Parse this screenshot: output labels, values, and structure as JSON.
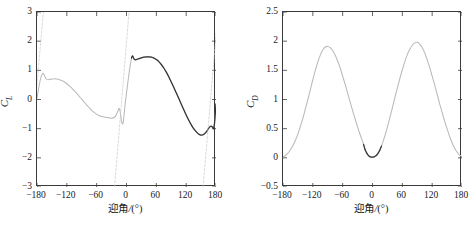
{
  "figure": {
    "width": 474,
    "height": 230,
    "background": "#ffffff"
  },
  "colors": {
    "axis": "#3b3b3b",
    "curve_light": "#b9b9b9",
    "curve_dark": "#343434",
    "dashed_ref": "#c9c9c9",
    "text": "#1a1a1a"
  },
  "panels": [
    {
      "id": "left",
      "ylabel_main": "C",
      "ylabel_sub": "L",
      "xlabel_cn": "迎角",
      "xlabel_unit": "/(°)"
    },
    {
      "id": "right",
      "ylabel_main": "C",
      "ylabel_sub": "D",
      "xlabel_cn": "迎角",
      "xlabel_unit": "/(°)"
    }
  ],
  "chart_data": [
    {
      "type": "line",
      "id": "lift-coefficient-plot",
      "title": "",
      "xlabel": "迎角/(°)",
      "ylabel": "C_L",
      "xlim": [
        -180,
        180
      ],
      "ylim": [
        -3,
        3
      ],
      "xticks": [
        -180,
        -120,
        -60,
        0,
        60,
        120,
        180
      ],
      "xticklabels": [
        "−180",
        "−120",
        "−60",
        "0",
        "60",
        "120",
        "180"
      ],
      "yticks": [
        -3,
        -2,
        -1,
        0,
        1,
        2,
        3
      ],
      "yticklabels": [
        "−3",
        "−2",
        "−1",
        "0",
        "1",
        "2",
        "3"
      ],
      "grid": false,
      "legend": "none",
      "series": [
        {
          "name": "CL-360deg-light",
          "color": "#b9b9b9",
          "style": "solid",
          "x": [
            -180,
            -177,
            -174,
            -171,
            -168,
            -166,
            -164,
            -162,
            -160,
            -157,
            -154,
            -150,
            -145,
            -140,
            -135,
            -130,
            -125,
            -120,
            -115,
            -110,
            -105,
            -100,
            -95,
            -90,
            -85,
            -80,
            -75,
            -70,
            -65,
            -60,
            -55,
            -50,
            -45,
            -40,
            -35,
            -30,
            -25,
            -22,
            -20,
            -18,
            -16,
            -15,
            -14,
            -13,
            -12,
            -11,
            -10,
            -9,
            -8,
            -7,
            -6,
            -5,
            -3,
            0,
            3,
            5,
            7,
            9,
            11,
            12,
            13,
            14,
            15,
            16,
            17,
            18,
            20,
            22,
            25,
            30,
            35,
            40,
            45,
            50,
            55,
            60,
            65,
            70,
            75,
            80,
            85,
            90,
            95,
            100,
            105,
            110,
            115,
            120,
            125,
            130,
            135,
            140,
            145,
            150,
            155,
            160,
            163,
            166,
            169,
            171,
            173,
            175,
            177,
            180
          ],
          "y": [
            0.05,
            0.35,
            0.62,
            0.82,
            0.9,
            0.86,
            0.78,
            0.72,
            0.69,
            0.68,
            0.69,
            0.7,
            0.71,
            0.7,
            0.68,
            0.65,
            0.6,
            0.54,
            0.47,
            0.39,
            0.3,
            0.21,
            0.11,
            0.01,
            -0.09,
            -0.19,
            -0.28,
            -0.37,
            -0.44,
            -0.5,
            -0.55,
            -0.58,
            -0.6,
            -0.62,
            -0.63,
            -0.64,
            -0.62,
            -0.57,
            -0.5,
            -0.42,
            -0.34,
            -0.3,
            -0.33,
            -0.4,
            -0.5,
            -0.62,
            -0.73,
            -0.8,
            -0.84,
            -0.82,
            -0.72,
            -0.55,
            -0.2,
            0.22,
            0.62,
            0.88,
            1.12,
            1.32,
            1.46,
            1.5,
            1.5,
            1.46,
            1.41,
            1.38,
            1.37,
            1.37,
            1.38,
            1.39,
            1.4,
            1.43,
            1.45,
            1.46,
            1.46,
            1.45,
            1.42,
            1.37,
            1.3,
            1.2,
            1.08,
            0.94,
            0.78,
            0.6,
            0.42,
            0.23,
            0.04,
            -0.15,
            -0.34,
            -0.53,
            -0.7,
            -0.86,
            -1.0,
            -1.1,
            -1.18,
            -1.22,
            -1.2,
            -1.12,
            -1.05,
            -0.97,
            -0.92,
            -0.92,
            -0.95,
            -1.0,
            -0.82,
            -0.15
          ]
        },
        {
          "name": "CL-measured-dark",
          "color": "#343434",
          "style": "solid",
          "x": [
            10,
            12,
            14,
            16,
            18,
            20,
            25,
            30,
            35,
            40,
            45,
            50,
            55,
            60,
            65,
            70,
            75,
            80,
            85,
            90,
            95,
            100,
            105,
            110,
            115,
            120,
            125,
            130,
            135,
            140,
            145,
            150,
            155,
            160,
            163,
            166,
            169,
            171,
            173,
            175,
            177,
            180
          ],
          "y": [
            1.42,
            1.5,
            1.43,
            1.37,
            1.36,
            1.37,
            1.4,
            1.43,
            1.45,
            1.46,
            1.46,
            1.45,
            1.42,
            1.37,
            1.3,
            1.2,
            1.08,
            0.94,
            0.78,
            0.6,
            0.42,
            0.23,
            0.04,
            -0.15,
            -0.34,
            -0.53,
            -0.7,
            -0.86,
            -1.0,
            -1.1,
            -1.18,
            -1.22,
            -1.2,
            -1.12,
            -1.05,
            -0.97,
            -0.92,
            -0.92,
            -0.95,
            -1.0,
            -0.82,
            -0.15
          ]
        },
        {
          "name": "CL-linear-slope-ref-1",
          "color": "#c9c9c9",
          "style": "dashed",
          "x": [
            -186,
            -165
          ],
          "y": [
            -0.6,
            3.4
          ]
        },
        {
          "name": "CL-linear-slope-ref-2",
          "color": "#c9c9c9",
          "style": "dashed",
          "x": [
            -26,
            7
          ],
          "y": [
            -3.4,
            3.4
          ]
        },
        {
          "name": "CL-linear-slope-ref-3",
          "color": "#c9c9c9",
          "style": "dashed",
          "x": [
            152,
            186
          ],
          "y": [
            -3.4,
            3.4
          ]
        }
      ]
    },
    {
      "type": "line",
      "id": "drag-coefficient-plot",
      "title": "",
      "xlabel": "迎角/(°)",
      "ylabel": "C_D",
      "xlim": [
        -180,
        180
      ],
      "ylim": [
        -0.5,
        2.5
      ],
      "xticks": [
        -180,
        -120,
        -60,
        0,
        60,
        120,
        180
      ],
      "xticklabels": [
        "−180",
        "−120",
        "−60",
        "0",
        "60",
        "120",
        "180"
      ],
      "yticks": [
        -0.5,
        0,
        0.5,
        1,
        1.5,
        2,
        2.5
      ],
      "yticklabels": [
        "−0.5",
        "0",
        "0.5",
        "1",
        "1.5",
        "2",
        "2.5"
      ],
      "grid": false,
      "legend": "none",
      "series": [
        {
          "name": "CD-360deg-light",
          "color": "#b9b9b9",
          "style": "solid",
          "x": [
            -180,
            -175,
            -170,
            -165,
            -160,
            -155,
            -150,
            -145,
            -140,
            -135,
            -130,
            -125,
            -120,
            -115,
            -110,
            -105,
            -100,
            -95,
            -90,
            -85,
            -80,
            -75,
            -70,
            -65,
            -60,
            -55,
            -50,
            -45,
            -40,
            -35,
            -30,
            -25,
            -22,
            -20,
            -18,
            -16,
            -14,
            -12,
            -10,
            -8,
            -6,
            -4,
            -2,
            0,
            2,
            4,
            6,
            8,
            10,
            12,
            14,
            16,
            18,
            20,
            22,
            25,
            30,
            35,
            40,
            45,
            50,
            55,
            60,
            65,
            70,
            75,
            80,
            85,
            90,
            95,
            100,
            105,
            110,
            115,
            120,
            125,
            130,
            135,
            140,
            145,
            150,
            155,
            160,
            165,
            170,
            175,
            180
          ],
          "y": [
            0.02,
            0.04,
            0.08,
            0.14,
            0.21,
            0.3,
            0.41,
            0.54,
            0.68,
            0.84,
            1.0,
            1.17,
            1.34,
            1.5,
            1.64,
            1.76,
            1.85,
            1.9,
            1.91,
            1.89,
            1.84,
            1.76,
            1.66,
            1.54,
            1.4,
            1.26,
            1.11,
            0.96,
            0.81,
            0.67,
            0.53,
            0.4,
            0.33,
            0.28,
            0.23,
            0.17,
            0.12,
            0.09,
            0.06,
            0.04,
            0.025,
            0.015,
            0.012,
            0.012,
            0.014,
            0.02,
            0.03,
            0.045,
            0.065,
            0.09,
            0.12,
            0.16,
            0.2,
            0.25,
            0.3,
            0.38,
            0.53,
            0.69,
            0.86,
            1.03,
            1.2,
            1.36,
            1.51,
            1.65,
            1.77,
            1.86,
            1.93,
            1.97,
            1.98,
            1.95,
            1.89,
            1.8,
            1.68,
            1.55,
            1.4,
            1.25,
            1.09,
            0.93,
            0.78,
            0.63,
            0.5,
            0.37,
            0.26,
            0.17,
            0.1,
            0.05,
            0.02
          ]
        },
        {
          "name": "CD-measured-dark",
          "color": "#343434",
          "style": "solid",
          "x": [
            -18,
            -16,
            -14,
            -12,
            -10,
            -8,
            -6,
            -4,
            -2,
            0,
            2,
            4,
            6,
            8,
            10,
            12,
            14,
            16,
            18
          ],
          "y": [
            0.23,
            0.17,
            0.12,
            0.09,
            0.06,
            0.04,
            0.025,
            0.015,
            0.012,
            0.012,
            0.014,
            0.02,
            0.03,
            0.045,
            0.065,
            0.09,
            0.12,
            0.16,
            0.2
          ]
        }
      ]
    }
  ]
}
